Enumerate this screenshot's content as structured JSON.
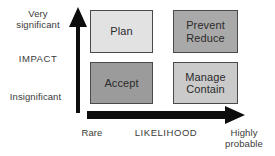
{
  "diagram": {
    "background_color": "#ffffff",
    "arrow_color": "#0d0d0d",
    "border_color": "#4a4a4a",
    "text_color": "#3a3a3a"
  },
  "y_axis": {
    "name": "IMPACT",
    "label": "IMPACT",
    "top_label": "Very\nsignificant",
    "bottom_label": "Insignificant",
    "arrow_icon": "up-arrow-icon"
  },
  "x_axis": {
    "name": "LIKELIHOOD",
    "label": "LIKELIHOOD",
    "start_label": "Rare",
    "end_label": "Highly\nprobable",
    "arrow_icon": "right-arrow-icon"
  },
  "cells": [
    {
      "id": "plan",
      "label": "Plan",
      "fill": "#e2e2e2",
      "impact": "Very significant",
      "likelihood": "Rare"
    },
    {
      "id": "prevent-reduce",
      "label": "Prevent\nReduce",
      "fill": "#a9a9a9",
      "impact": "Very significant",
      "likelihood": "Highly probable"
    },
    {
      "id": "accept",
      "label": "Accept",
      "fill": "#9b9b9b",
      "impact": "Insignificant",
      "likelihood": "Rare"
    },
    {
      "id": "manage-contain",
      "label": "Manage\nContain",
      "fill": "#cacaca",
      "impact": "Insignificant",
      "likelihood": "Highly probable"
    }
  ]
}
